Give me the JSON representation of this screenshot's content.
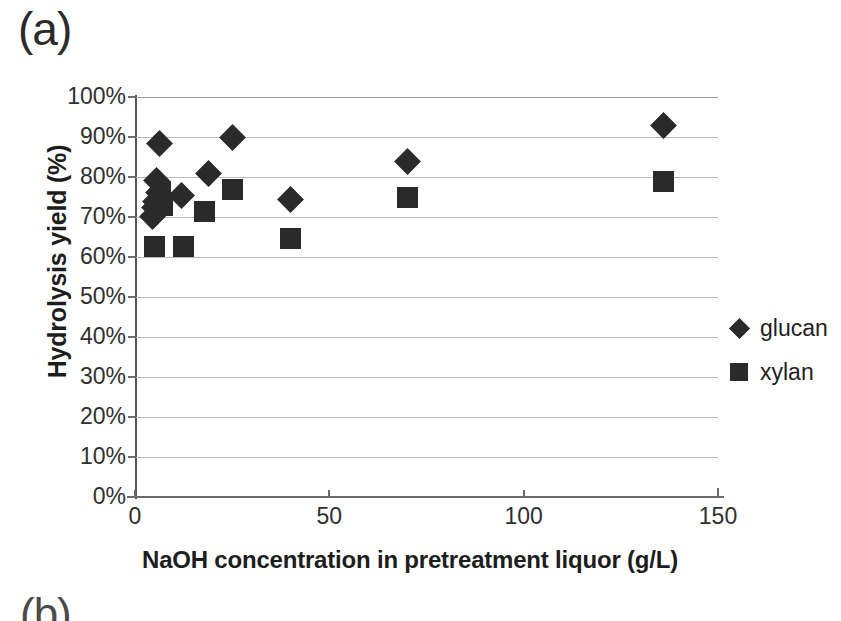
{
  "panel": {
    "label_a": "(a)",
    "label_b": "(b)"
  },
  "chart_data": {
    "type": "scatter",
    "title": "",
    "xlabel": "NaOH concentration in pretreatment liquor (g/L)",
    "ylabel": "Hydrolysis yield (%)",
    "xlim": [
      0,
      150
    ],
    "ylim": [
      0,
      100
    ],
    "xticks": [
      0,
      50,
      100,
      150
    ],
    "xtick_labels": [
      "0",
      "50",
      "100",
      "150"
    ],
    "yticks": [
      0,
      10,
      20,
      30,
      40,
      50,
      60,
      70,
      80,
      90,
      100
    ],
    "ytick_labels": [
      "0%",
      "10%",
      "20%",
      "30%",
      "40%",
      "50%",
      "60%",
      "70%",
      "80%",
      "90%",
      "100%"
    ],
    "grid": "horizontal",
    "legend_position": "right",
    "marker_color": "#2a2a2a",
    "series": [
      {
        "name": "glucan",
        "marker": "diamond",
        "points": [
          [
            4.5,
            70.2
          ],
          [
            5.0,
            72.3
          ],
          [
            5.4,
            74.0
          ],
          [
            6.0,
            76.2
          ],
          [
            5.6,
            79.2
          ],
          [
            6.2,
            88.5
          ],
          [
            12.0,
            75.4
          ],
          [
            19.0,
            81.0
          ],
          [
            25.0,
            89.8
          ],
          [
            40.0,
            74.5
          ],
          [
            70.0,
            84.0
          ],
          [
            136.0,
            93.0
          ]
        ]
      },
      {
        "name": "xylan",
        "marker": "square",
        "points": [
          [
            5.0,
            62.6
          ],
          [
            6.5,
            76.4
          ],
          [
            7.0,
            73.0
          ],
          [
            12.5,
            62.6
          ],
          [
            18.0,
            71.4
          ],
          [
            25.0,
            77.0
          ],
          [
            40.0,
            64.6
          ],
          [
            70.0,
            75.0
          ],
          [
            136.0,
            79.0
          ]
        ]
      }
    ]
  },
  "legend": {
    "entries": [
      {
        "label": "glucan",
        "marker": "diamond"
      },
      {
        "label": "xylan",
        "marker": "square"
      }
    ]
  }
}
